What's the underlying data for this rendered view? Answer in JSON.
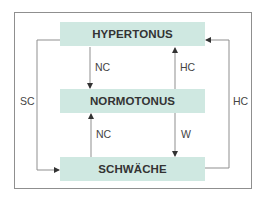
{
  "diagram": {
    "states": {
      "top": "HYPERTONUS",
      "middle": "NORMOTONUS",
      "bottom": "SCHWÄCHE"
    },
    "edges": [
      {
        "from": "HYPERTONUS",
        "to": "NORMOTONUS",
        "label": "NC"
      },
      {
        "from": "NORMOTONUS",
        "to": "HYPERTONUS",
        "label": "HC"
      },
      {
        "from": "SCHWÄCHE",
        "to": "NORMOTONUS",
        "label": "NC"
      },
      {
        "from": "NORMOTONUS",
        "to": "SCHWÄCHE",
        "label": "W"
      },
      {
        "from": "HYPERTONUS",
        "to": "SCHWÄCHE",
        "label": "SC"
      },
      {
        "from": "SCHWÄCHE",
        "to": "HYPERTONUS",
        "label": "HC"
      }
    ],
    "labels": {
      "top_down": "NC",
      "top_up": "HC",
      "bottom_up": "NC",
      "bottom_down": "W",
      "left": "SC",
      "right": "HC"
    },
    "colors": {
      "box_fill": "#cfe8e1",
      "line": "#8f8f8f",
      "text": "#333333"
    }
  }
}
